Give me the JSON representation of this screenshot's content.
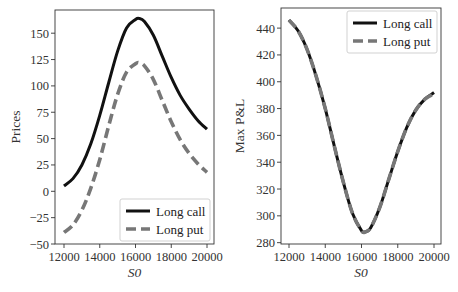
{
  "chart_data": [
    {
      "type": "line",
      "panel": "left",
      "title": "",
      "xlabel": "S0",
      "ylabel": "Prices",
      "xlim": [
        11800,
        20200
      ],
      "ylim": [
        -50,
        172
      ],
      "xticks": [
        12000,
        14000,
        16000,
        18000,
        20000
      ],
      "yticks": [
        -50,
        -25,
        0,
        25,
        50,
        75,
        100,
        125,
        150
      ],
      "ytick_labels": [
        "−50",
        "−25",
        "0",
        "25",
        "50",
        "75",
        "100",
        "125",
        "150"
      ],
      "grid": false,
      "legend_position": "lower right",
      "x": [
        12000,
        12500,
        13000,
        13500,
        14000,
        14500,
        15000,
        15500,
        16000,
        16200,
        16500,
        17000,
        17500,
        18000,
        18500,
        19000,
        19500,
        20000
      ],
      "series": [
        {
          "name": "Long call",
          "style": "solid",
          "color": "#111111",
          "values": [
            5,
            12,
            25,
            45,
            72,
            103,
            133,
            155,
            163,
            164,
            161,
            148,
            128,
            108,
            91,
            78,
            67,
            59
          ]
        },
        {
          "name": "Long put",
          "style": "dashed",
          "color": "#777777",
          "values": [
            -39,
            -32,
            -18,
            3,
            30,
            62,
            92,
            113,
            121,
            122,
            119,
            106,
            86,
            66,
            49,
            36,
            26,
            18
          ]
        }
      ]
    },
    {
      "type": "line",
      "panel": "right",
      "title": "",
      "xlabel": "S0",
      "ylabel": "Max P&L",
      "xlim": [
        11800,
        20200
      ],
      "ylim": [
        279,
        455
      ],
      "xticks": [
        12000,
        14000,
        16000,
        18000,
        20000
      ],
      "yticks": [
        280,
        300,
        320,
        340,
        360,
        380,
        400,
        420,
        440
      ],
      "ytick_labels": [
        "280",
        "300",
        "320",
        "340",
        "360",
        "380",
        "400",
        "420",
        "440"
      ],
      "grid": false,
      "legend_position": "upper right",
      "x": [
        12000,
        12500,
        13000,
        13500,
        14000,
        14500,
        15000,
        15500,
        16000,
        16200,
        16500,
        17000,
        17500,
        18000,
        18500,
        19000,
        19500,
        20000
      ],
      "series": [
        {
          "name": "Long call",
          "style": "solid",
          "color": "#111111",
          "values": [
            446,
            438,
            424,
            404,
            380,
            352,
            325,
            302,
            289,
            288,
            291,
            306,
            327,
            348,
            366,
            379,
            387,
            392
          ]
        },
        {
          "name": "Long put",
          "style": "dashed",
          "color": "#777777",
          "values": [
            446,
            438,
            424,
            404,
            380,
            352,
            325,
            302,
            289,
            288,
            291,
            306,
            327,
            348,
            366,
            379,
            387,
            391
          ]
        }
      ]
    }
  ],
  "layout": {
    "panels": [
      {
        "left": 55,
        "top": 10,
        "right": 214,
        "bottom": 244,
        "x0px": 64,
        "x1px": 207,
        "ylab_x": 20
      },
      {
        "left": 281,
        "top": 8,
        "right": 441,
        "bottom": 244,
        "x0px": 289,
        "x1px": 434,
        "ylab_x": 244
      }
    ]
  }
}
